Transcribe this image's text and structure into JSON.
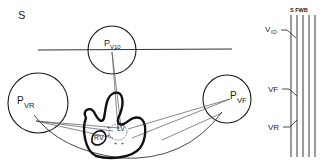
{
  "figure": {
    "panel_label": "S",
    "nodes": {
      "p_v10": {
        "main": "P",
        "sub": "V10"
      },
      "p_vr": {
        "main": "P",
        "sub": "VR"
      },
      "p_vf": {
        "main": "P",
        "sub": "VF"
      }
    },
    "heart": {
      "rv_label": "RV",
      "lv_label": "LV"
    },
    "bus": {
      "header": "S FWB",
      "leads": [
        {
          "label": "V10"
        },
        {
          "label": "VF"
        },
        {
          "label": "VR"
        }
      ]
    },
    "colors": {
      "ink": "#1a1a1a",
      "thin_line": "#555555",
      "background": "#ffffff"
    }
  }
}
